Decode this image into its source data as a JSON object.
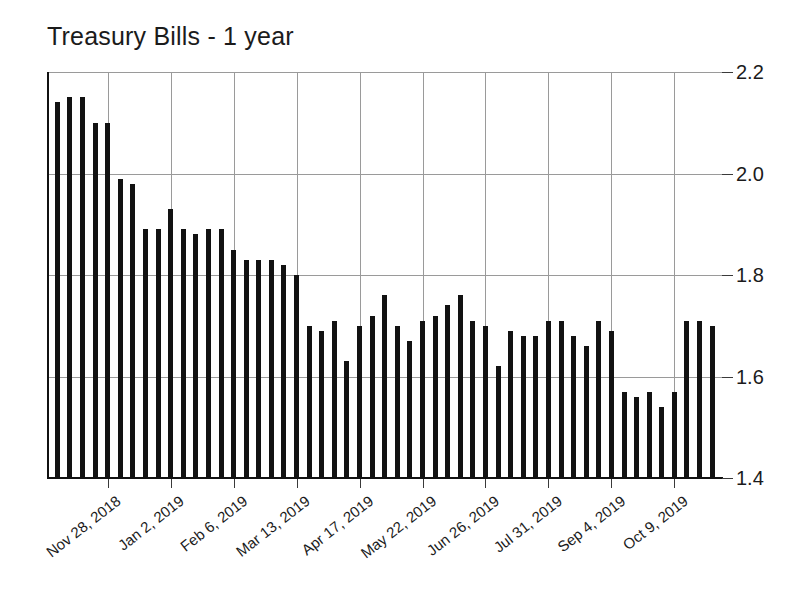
{
  "chart_data": {
    "type": "bar",
    "title": "Treasury Bills - 1 year",
    "xlabel": "",
    "ylabel": "",
    "ylim": [
      1.4,
      2.2
    ],
    "ytick_values": [
      1.4,
      1.6,
      1.8,
      2.0,
      2.2
    ],
    "ytick_labels": [
      "1.4",
      "1.6",
      "1.8",
      "2.0",
      "2.2"
    ],
    "ytick_position": "right",
    "grid": true,
    "legend": false,
    "bar_color": "#121212",
    "axis_color": "#111111",
    "grid_color": "#9a9a9a",
    "xtick_labels": [
      "Nov 28, 2018",
      "Jan 2, 2019",
      "Feb 6, 2019",
      "Mar 13, 2019",
      "Apr 17, 2019",
      "May 22, 2019",
      "Jun 26, 2019",
      "Jul 31, 2019",
      "Sep 4, 2019",
      "Oct 9, 2019"
    ],
    "xtick_label_rotation_deg": -38,
    "xtick_interval_bars": 5,
    "xtick_first_bar_index": 4,
    "categories": [
      "Oct 31, 2018",
      "Nov 7, 2018",
      "Nov 14, 2018",
      "Nov 21, 2018",
      "Nov 28, 2018",
      "Dec 5, 2018",
      "Dec 12, 2018",
      "Dec 19, 2018",
      "Dec 26, 2018",
      "Jan 2, 2019",
      "Jan 9, 2019",
      "Jan 16, 2019",
      "Jan 23, 2019",
      "Jan 30, 2019",
      "Feb 6, 2019",
      "Feb 13, 2019",
      "Feb 20, 2019",
      "Feb 27, 2019",
      "Mar 6, 2019",
      "Mar 13, 2019",
      "Mar 20, 2019",
      "Mar 27, 2019",
      "Apr 3, 2019",
      "Apr 10, 2019",
      "Apr 17, 2019",
      "Apr 24, 2019",
      "May 1, 2019",
      "May 8, 2019",
      "May 15, 2019",
      "May 22, 2019",
      "May 29, 2019",
      "Jun 5, 2019",
      "Jun 12, 2019",
      "Jun 19, 2019",
      "Jun 26, 2019",
      "Jul 3, 2019",
      "Jul 10, 2019",
      "Jul 17, 2019",
      "Jul 24, 2019",
      "Jul 31, 2019",
      "Aug 7, 2019",
      "Aug 14, 2019",
      "Aug 21, 2019",
      "Aug 28, 2019",
      "Sep 4, 2019",
      "Sep 11, 2019",
      "Sep 18, 2019",
      "Sep 25, 2019",
      "Oct 2, 2019",
      "Oct 9, 2019",
      "Oct 16, 2019",
      "Oct 23, 2019",
      "Oct 30, 2019"
    ],
    "values": [
      2.14,
      2.15,
      2.15,
      2.1,
      2.1,
      1.99,
      1.98,
      1.89,
      1.89,
      1.93,
      1.89,
      1.88,
      1.89,
      1.89,
      1.85,
      1.83,
      1.83,
      1.83,
      1.82,
      1.8,
      1.7,
      1.69,
      1.71,
      1.63,
      1.7,
      1.72,
      1.76,
      1.7,
      1.67,
      1.71,
      1.72,
      1.74,
      1.76,
      1.71,
      1.7,
      1.62,
      1.69,
      1.68,
      1.68,
      1.71,
      1.71,
      1.68,
      1.66,
      1.71,
      1.69,
      1.57,
      1.56,
      1.57,
      1.54,
      1.57,
      1.71,
      1.71,
      1.7
    ]
  }
}
